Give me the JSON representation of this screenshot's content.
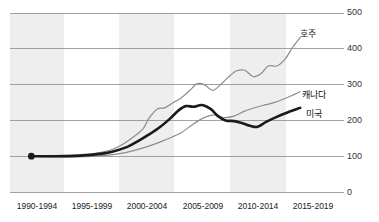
{
  "chart_data": {
    "type": "line",
    "title": "",
    "subtitle": "",
    "xlabel": "",
    "ylabel": "",
    "categories": [
      "1990-1994",
      "1995-1999",
      "2000-2004",
      "2005-2009",
      "2010-2014",
      "2015-2019"
    ],
    "x": [
      1992,
      1997,
      2002,
      2007,
      2012,
      2017
    ],
    "ylim": [
      0,
      500
    ],
    "yticks": [
      0,
      100,
      200,
      300,
      400,
      500
    ],
    "ytick_labels": [
      "0",
      "100",
      "200",
      "300",
      "400",
      "500"
    ],
    "grid": "horizontal",
    "legend": "inline-right-end-labels",
    "banded_background": true,
    "baseline_marker": {
      "x": 1992.0,
      "y": 100,
      "label": ""
    },
    "series": [
      {
        "name": "호주",
        "label": "호주",
        "color": "#8c8c8c",
        "width": 1.2,
        "x": [
          1992.0,
          1993.5,
          1995.0,
          1996.5,
          1998.0,
          1999.5,
          2000.5,
          2001.5,
          2002.5,
          2003.0,
          2003.8,
          2004.5,
          2005.2,
          2006.0,
          2006.8,
          2007.5,
          2008.2,
          2009.0,
          2009.8,
          2010.5,
          2011.2,
          2012.0,
          2012.8,
          2013.5,
          2014.2,
          2015.0,
          2015.8,
          2016.5,
          2017.2
        ],
        "y": [
          100,
          100,
          101,
          103,
          108,
          118,
          132,
          152,
          178,
          205,
          232,
          235,
          248,
          262,
          282,
          302,
          300,
          284,
          302,
          322,
          338,
          340,
          322,
          330,
          352,
          352,
          372,
          405,
          432
        ]
      },
      {
        "name": "캐나다",
        "label": "캐나다",
        "color": "#8c8c8c",
        "width": 1.2,
        "x": [
          1992.0,
          1994.0,
          1996.0,
          1998.0,
          2000.0,
          2001.5,
          2003.0,
          2004.5,
          2006.0,
          2007.0,
          2008.0,
          2009.0,
          2010.0,
          2011.0,
          2012.0,
          2013.0,
          2014.0,
          2015.0,
          2016.0,
          2017.2
        ],
        "y": [
          100,
          98,
          98,
          100,
          106,
          115,
          128,
          145,
          165,
          186,
          205,
          215,
          208,
          212,
          226,
          236,
          244,
          252,
          264,
          280
        ]
      },
      {
        "name": "미국",
        "label": "미국",
        "color": "#1a1a1a",
        "width": 2.6,
        "x": [
          1992.0,
          1994.0,
          1996.0,
          1998.0,
          1999.5,
          2001.0,
          2002.0,
          2003.0,
          2004.0,
          2005.0,
          2005.8,
          2006.5,
          2007.2,
          2008.0,
          2008.8,
          2009.5,
          2010.2,
          2011.0,
          2011.8,
          2012.5,
          2013.2,
          2014.0,
          2015.0,
          2016.0,
          2017.2
        ],
        "y": [
          100,
          100,
          101,
          105,
          112,
          126,
          142,
          160,
          180,
          205,
          228,
          240,
          238,
          243,
          232,
          212,
          200,
          198,
          192,
          185,
          182,
          196,
          210,
          222,
          235
        ]
      }
    ],
    "bands": [
      {
        "from": "1990-1994",
        "to": "1990-1994"
      },
      {
        "from": "2000-2004",
        "to": "2000-2004"
      },
      {
        "from": "2010-2014",
        "to": "2010-2014"
      }
    ]
  },
  "colors": {
    "background": "#ffffff",
    "band": "#eeeeee",
    "gridline": "#8b8b8b",
    "tick_text": "#333333",
    "highlight_series": "#1a1a1a",
    "other_series": "#8c8c8c"
  }
}
